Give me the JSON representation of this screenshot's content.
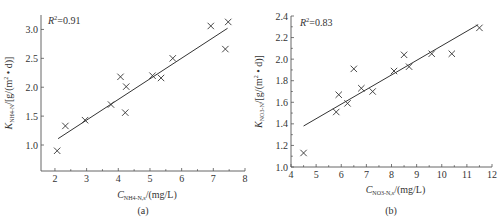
{
  "chart_data": [
    {
      "type": "scatter",
      "panel_label": "(a)",
      "title": "",
      "annotation": "R²=0.91",
      "annotation_r2": "0.91",
      "xlabel": "C_NH4-N,s/(mg/L)",
      "xlabel_main": "C",
      "xlabel_sub": "NH4-N,s",
      "xlabel_unit": "/(mg/L)",
      "ylabel": "K_NH4-N/[g/(m²·d)]",
      "ylabel_main": "K",
      "ylabel_sub": "NH4-N",
      "ylabel_unit": "/[g/(m² • d)]",
      "xlim": [
        1.56,
        8
      ],
      "ylim": [
        0.55,
        3.25
      ],
      "xticks": [
        2,
        3,
        4,
        5,
        6,
        7,
        8
      ],
      "yticks": [
        1.0,
        1.5,
        2.0,
        2.5,
        3.0
      ],
      "grid": false,
      "legend": "none",
      "points": [
        {
          "x": 2.07,
          "y": 0.9
        },
        {
          "x": 2.33,
          "y": 1.33
        },
        {
          "x": 2.95,
          "y": 1.43
        },
        {
          "x": 3.77,
          "y": 1.7
        },
        {
          "x": 4.07,
          "y": 2.18
        },
        {
          "x": 4.22,
          "y": 1.56
        },
        {
          "x": 4.25,
          "y": 2.01
        },
        {
          "x": 5.08,
          "y": 2.2
        },
        {
          "x": 5.35,
          "y": 2.16
        },
        {
          "x": 5.72,
          "y": 2.5
        },
        {
          "x": 6.92,
          "y": 3.06
        },
        {
          "x": 7.38,
          "y": 2.66
        },
        {
          "x": 7.47,
          "y": 3.13
        }
      ],
      "fit_line": {
        "x": [
          2.1,
          7.45
        ],
        "y": [
          1.11,
          3.02
        ]
      }
    },
    {
      "type": "scatter",
      "panel_label": "(b)",
      "title": "",
      "annotation": "R²=0.83",
      "annotation_r2": "0.83",
      "xlabel": "C_NO3-N,s/(mg/L)",
      "xlabel_main": "C",
      "xlabel_sub": "NO3-N,s",
      "xlabel_unit": "/(mg/L)",
      "ylabel": "K_NO3-N/[g/(m²·d)]",
      "ylabel_main": "K",
      "ylabel_sub": "NO3-N",
      "ylabel_unit": "/[g/(m² • d)]",
      "xlim": [
        4,
        12
      ],
      "ylim": [
        1.0,
        2.4
      ],
      "xticks": [
        4,
        5,
        6,
        7,
        8,
        9,
        10,
        11,
        12
      ],
      "yticks": [
        1.0,
        1.2,
        1.4,
        1.6,
        1.8,
        2.0,
        2.2,
        2.4
      ],
      "grid": false,
      "legend": "none",
      "points": [
        {
          "x": 4.5,
          "y": 1.13
        },
        {
          "x": 5.8,
          "y": 1.51
        },
        {
          "x": 5.9,
          "y": 1.67
        },
        {
          "x": 6.25,
          "y": 1.59
        },
        {
          "x": 6.5,
          "y": 1.91
        },
        {
          "x": 6.8,
          "y": 1.73
        },
        {
          "x": 7.25,
          "y": 1.7
        },
        {
          "x": 8.1,
          "y": 1.89
        },
        {
          "x": 8.5,
          "y": 2.04
        },
        {
          "x": 8.7,
          "y": 1.93
        },
        {
          "x": 9.6,
          "y": 2.05
        },
        {
          "x": 10.4,
          "y": 2.05
        },
        {
          "x": 11.5,
          "y": 2.29
        }
      ],
      "fit_line": {
        "x": [
          4.5,
          11.45
        ],
        "y": [
          1.38,
          2.32
        ]
      }
    }
  ]
}
